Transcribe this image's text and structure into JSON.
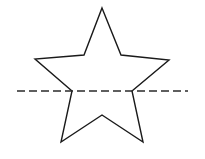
{
  "diagram": {
    "background_color": "#ffffff",
    "star": {
      "name": "five-pointed-star",
      "stroke_color": "#1a1a1a",
      "points": [
        [
          102,
          8
        ],
        [
          121,
          55
        ],
        [
          169,
          60
        ],
        [
          132,
          91
        ],
        [
          143,
          142
        ],
        [
          102,
          115
        ],
        [
          61,
          142
        ],
        [
          72,
          91
        ],
        [
          35,
          59
        ],
        [
          84,
          55
        ]
      ]
    },
    "dashed_line": {
      "name": "horizontal-dashed-line",
      "stroke_color": "#2a2a2a",
      "x1": 17,
      "y1": 91,
      "x2": 188,
      "y2": 91,
      "dash": [
        8,
        4
      ]
    }
  }
}
